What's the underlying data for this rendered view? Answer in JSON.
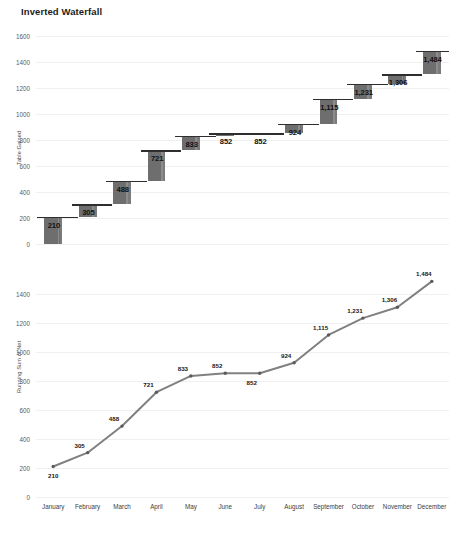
{
  "title": "Inverted Waterfall",
  "chart_data": [
    {
      "type": "bar",
      "title": "Inverted Waterfall",
      "subtype": "inverted-waterfall",
      "xlabel": "",
      "ylabel": "Table Gained",
      "categories": [
        "January",
        "February",
        "March",
        "April",
        "May",
        "June",
        "July",
        "August",
        "September",
        "October",
        "November",
        "December"
      ],
      "values": [
        210,
        305,
        488,
        721,
        833,
        852,
        852,
        924,
        1115,
        1231,
        1306,
        1484
      ],
      "value_labels": [
        "210",
        "305",
        "488",
        "721",
        "833",
        "852",
        "852",
        "924",
        "1,115",
        "1,231",
        "1,306",
        "1,484"
      ],
      "bar_bottoms": [
        0,
        210,
        305,
        488,
        721,
        833,
        852,
        852,
        924,
        1115,
        1231,
        1306
      ],
      "ylim": [
        0,
        1600
      ],
      "yticks": [
        0,
        200,
        400,
        600,
        800,
        1000,
        1200,
        1400,
        1600
      ],
      "ytick_labels": [
        "0",
        "200",
        "400",
        "600",
        "800",
        "1000",
        "1200",
        "1400",
        "1600"
      ],
      "grid": true,
      "legend": "none",
      "bar_color": "#6e6e6e",
      "connector_color": "#2e2e2e"
    },
    {
      "type": "line",
      "title": "",
      "xlabel": "",
      "ylabel": "Running Sum of Net",
      "categories": [
        "January",
        "February",
        "March",
        "April",
        "May",
        "June",
        "July",
        "August",
        "September",
        "October",
        "November",
        "December"
      ],
      "values": [
        210,
        305,
        488,
        721,
        833,
        852,
        852,
        924,
        1115,
        1231,
        1306,
        1484
      ],
      "value_labels": [
        "210",
        "305",
        "488",
        "721",
        "833",
        "852",
        "852",
        "924",
        "1,115",
        "1,231",
        "1,306",
        "1,484"
      ],
      "label_positions": [
        "below",
        "above",
        "above",
        "above",
        "above",
        "above",
        "below",
        "above",
        "above",
        "above",
        "above",
        "above"
      ],
      "ylim": [
        0,
        1500
      ],
      "yticks": [
        0,
        200,
        400,
        600,
        800,
        1000,
        1200,
        1400
      ],
      "ytick_labels": [
        "0",
        "200",
        "400",
        "600",
        "800",
        "1000",
        "1200",
        "1400"
      ],
      "grid": true,
      "legend": "none",
      "line_color": "#808080",
      "marker_color": "#5a5a5a"
    }
  ],
  "x_axis_labels": [
    "January",
    "February",
    "March",
    "April",
    "May",
    "June",
    "July",
    "August",
    "September",
    "October",
    "November",
    "December"
  ]
}
